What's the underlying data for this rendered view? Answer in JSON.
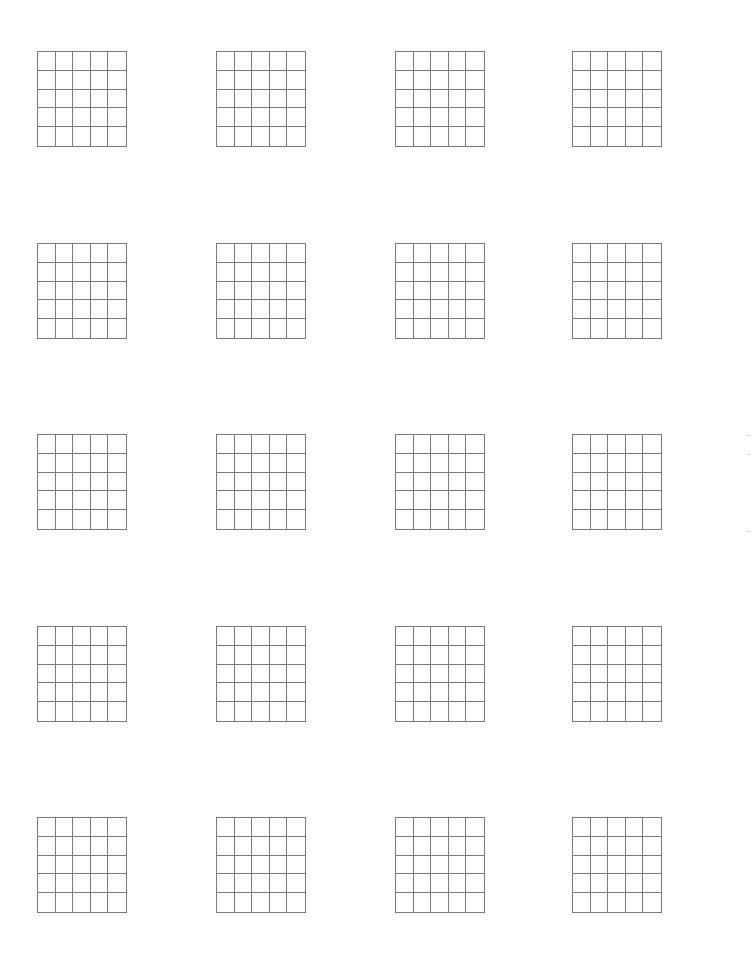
{
  "page": {
    "background": "#ffffff",
    "line_color": "#7a7a7a",
    "grid_rows": 5,
    "grid_cols": 5
  },
  "layout": {
    "columns_x": [
      37,
      216,
      395,
      572
    ],
    "rows_y": [
      51,
      243,
      434,
      626,
      817
    ],
    "grid_width": 90,
    "grid_height": 96
  },
  "edge_marks": [
    {
      "x": 747,
      "y": 435
    },
    {
      "x": 747,
      "y": 454
    },
    {
      "x": 747,
      "y": 531
    }
  ]
}
